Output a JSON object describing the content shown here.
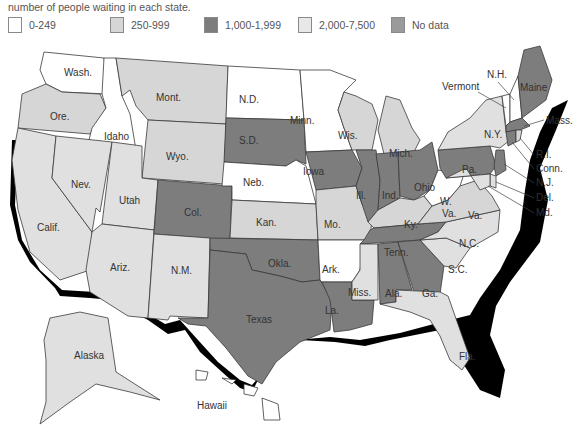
{
  "caption": "number of people waiting in each state.",
  "legend": [
    {
      "label": "0-249",
      "color": "#ffffff"
    },
    {
      "label": "250-999",
      "color": "#d6d6d6"
    },
    {
      "label": "1,000-1,999",
      "color": "#7d7d7d"
    },
    {
      "label": "2,000-7,500",
      "color": "#e8e8e8"
    },
    {
      "label": "No data",
      "color": "#9a9a9a"
    }
  ],
  "states": {
    "wa": "Wash.",
    "or": "Ore.",
    "ca": "Calif.",
    "id": "Idaho",
    "nv": "Nev.",
    "mt": "Mont.",
    "wy": "Wyo.",
    "ut": "Utah",
    "az": "Ariz.",
    "co": "Col.",
    "nm": "N.M.",
    "nd": "N.D.",
    "sd": "S.D.",
    "ne": "Neb.",
    "ks": "Kan.",
    "ok": "Okla.",
    "tx": "Texas",
    "mn": "Minn.",
    "ia": "Iowa",
    "mo": "Mo.",
    "ar": "Ark.",
    "la": "La.",
    "wi": "Wis.",
    "il": "Ill.",
    "mi": "Mich.",
    "in": "Ind.",
    "oh": "Ohio",
    "ky": "Ky.",
    "tn": "Tenn.",
    "ms": "Miss.",
    "al": "Ala.",
    "ga": "Ga.",
    "fl": "Fla.",
    "sc": "S.C.",
    "nc": "N.C.",
    "va": "Va.",
    "wv1": "W.",
    "wv2": "Va.",
    "pa": "Pa.",
    "ny": "N.Y.",
    "vt": "Vermont",
    "nh": "N.H.",
    "me": "Maine",
    "ma": "Mass.",
    "ri": "R.I.",
    "ct": "Conn.",
    "nj": "N.J.",
    "de": "Del.",
    "md": "Md.",
    "ak": "Alaska",
    "hi": "Hawaii"
  },
  "map_data": {
    "type": "choropleth",
    "note": "Grayscale tiers; 1,000-1,999 vs No data and 250-999 vs 2,000-7,500 are visually close, so the assignments below are approximate.",
    "categories": [
      "0-249",
      "250-999",
      "1,000-1,999",
      "2,000-7,500",
      "No data"
    ],
    "fill_by_state": {
      "Wash.": "white",
      "Idaho": "white",
      "N.D.": "white",
      "Minn.": "white",
      "Neb.": "white",
      "Ark.": "white",
      "W. Va.": "white",
      "Vermont": "white",
      "N.H.": "white",
      "Ore.": "light gray",
      "Mont.": "light gray",
      "Wyo.": "light gray",
      "Nev.": "light gray",
      "Utah": "light gray",
      "Calif.": "light gray",
      "Ariz.": "light gray",
      "N.M.": "light gray",
      "Kan.": "light gray",
      "Mo.": "light gray",
      "Wis.": "light gray",
      "Mich.": "light gray",
      "Ky.": "light gray",
      "Va.": "light gray",
      "N.C.": "light gray",
      "S.C.": "light gray",
      "Fla.": "light gray",
      "Miss.": "light gray",
      "N.Y.": "light gray",
      "Alaska": "light gray",
      "S.D.": "dark gray",
      "Col.": "dark gray",
      "Iowa": "dark gray",
      "Ill.": "dark gray",
      "Ind.": "dark gray",
      "Ohio": "dark gray",
      "Okla.": "dark gray",
      "Texas": "dark gray",
      "La.": "dark gray",
      "Tenn.": "dark gray",
      "Ala.": "dark gray",
      "Ga.": "dark gray",
      "Pa.": "dark gray",
      "Maine": "dark gray",
      "Mass.": "dark gray",
      "Conn.": "dark gray",
      "N.J.": "dark gray"
    }
  }
}
